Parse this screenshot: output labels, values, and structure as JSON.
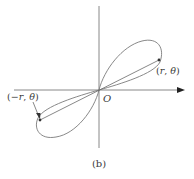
{
  "figure": {
    "caption": "(b)",
    "origin_label": "O",
    "point_positive": {
      "label_open": "(",
      "r": "r",
      "sep": ", ",
      "theta": "θ",
      "label_close": ")",
      "full": "(r, θ)"
    },
    "point_negative": {
      "label_open": "(",
      "r": "−r",
      "sep": ", ",
      "theta": "θ",
      "label_close": ")",
      "full": "(−r, θ)"
    },
    "colors": {
      "curve": "#7a7a7a",
      "axes": "#6a6a6a",
      "text": "#3a3a3a"
    }
  }
}
